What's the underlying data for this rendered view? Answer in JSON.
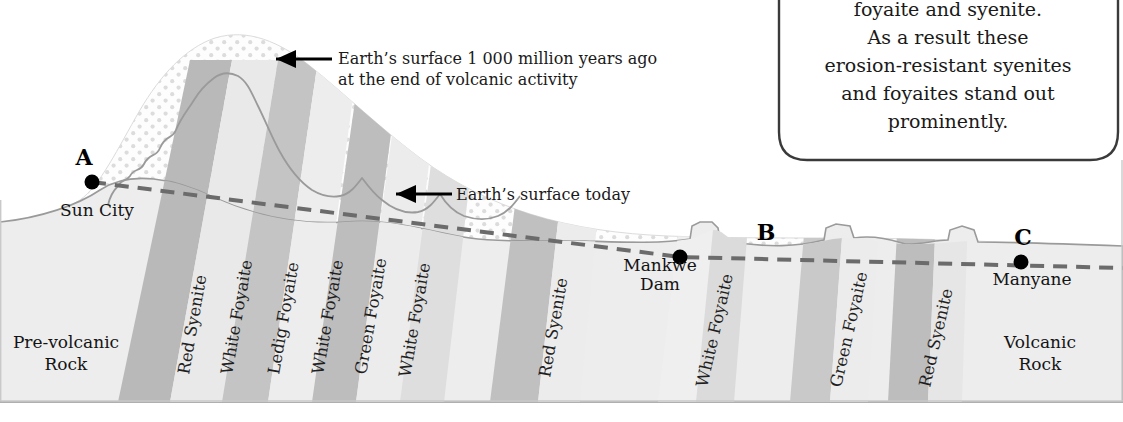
{
  "figure": {
    "type": "geological-cross-section",
    "caption": "Cross-section through the Pilanesberg Complex from Sun City (A) via Mankwe Dam (B) to Manyane (C)",
    "background_color": "#ffffff",
    "frame_color": "#c9c9c9"
  },
  "callout": {
    "text_lines": [
      "foyaite and syenite.",
      "As a result these",
      "erosion-resistant syenites",
      "and foyaites stand out",
      "prominently."
    ],
    "border_color": "#3a3a3a",
    "fill_color": "#ffffff"
  },
  "annotations": [
    {
      "id": "ancient-surface",
      "line1": "Earth’s  surface 1 000 million years ago",
      "line2": "at the end of volcanic activity",
      "arrow_color": "#000000"
    },
    {
      "id": "present-surface",
      "line1": "Earth’s surface today",
      "line2": "",
      "arrow_color": "#000000"
    }
  ],
  "points": [
    {
      "letter": "A",
      "place": "Sun City"
    },
    {
      "letter": "B",
      "place": "Mankwe Dam"
    },
    {
      "letter": "C",
      "place": "Manyane"
    }
  ],
  "regions": [
    {
      "id": "pre-volcanic",
      "line1": "Pre-volcanic",
      "line2": "Rock",
      "color": "#eeeeee"
    },
    {
      "id": "volcanic",
      "line1": "Volcanic",
      "line2": "Rock",
      "color": "#e2e2e2"
    }
  ],
  "rock_bands": [
    {
      "index": 1,
      "label": "Red Syenite",
      "tone": "dark"
    },
    {
      "index": 2,
      "label": "White Foyaite",
      "tone": "light"
    },
    {
      "index": 3,
      "label": "Ledig Foyaite",
      "tone": "dark"
    },
    {
      "index": 4,
      "label": "White Foyaite",
      "tone": "light"
    },
    {
      "index": 5,
      "label": "Green Foyaite",
      "tone": "dark"
    },
    {
      "index": 6,
      "label": "White Foyaite",
      "tone": "light"
    },
    {
      "index": 7,
      "label": "Red Syenite",
      "tone": "dark"
    },
    {
      "index": 8,
      "label": "White Foyaite",
      "tone": "light"
    },
    {
      "index": 9,
      "label": "Green Foyaite",
      "tone": "dark"
    },
    {
      "index": 10,
      "label": "Red Syenite",
      "tone": "dark"
    }
  ],
  "surfaces": {
    "ancient_label_key": "ancient-surface",
    "present_label_key": "present-surface",
    "dashed_line_color": "#6b6b6b",
    "outline_color": "#8a8a8a"
  },
  "palette": {
    "dark_band": "#b9b9b9",
    "light_band": "#e9e9e9",
    "mid_band": "#d2d2d2",
    "stipple_dot": "#d6d6d6",
    "stipple_bg": "#fcfcfc",
    "basement": "#ededed",
    "ink": "#1a1a1a"
  }
}
